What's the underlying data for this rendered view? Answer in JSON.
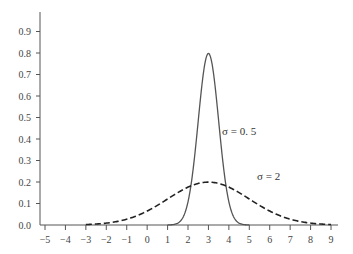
{
  "chart_data": {
    "type": "line",
    "title": "",
    "xlabel": "",
    "ylabel": "",
    "xlim": [
      -5,
      9
    ],
    "ylim": [
      0.0,
      0.9
    ],
    "grid": false,
    "legend": "none (inline annotations)",
    "x_ticks": [
      "−5",
      "−4",
      "−3",
      "−2",
      "−1",
      "0",
      "1",
      "2",
      "3",
      "4",
      "5",
      "6",
      "7",
      "8",
      "9"
    ],
    "y_ticks": [
      "0.0",
      "0.1",
      "0.2",
      "0.3",
      "0.4",
      "0.5",
      "0.6",
      "0.7",
      "0.8",
      "0.9"
    ],
    "series": [
      {
        "name": "σ = 0.5",
        "style": "solid",
        "mean": 3,
        "sd": 0.5,
        "x_range": [
          1,
          5
        ],
        "peak": 0.8,
        "x": [
          1,
          1.5,
          2,
          2.5,
          3,
          3.5,
          4,
          4.5,
          5
        ],
        "values": [
          0.0001,
          0.009,
          0.108,
          0.484,
          0.798,
          0.484,
          0.108,
          0.009,
          0.0001
        ]
      },
      {
        "name": "σ = 2",
        "style": "dashed",
        "mean": 3,
        "sd": 2,
        "x_range": [
          -3,
          9
        ],
        "peak": 0.2,
        "x": [
          -3,
          -2,
          -1,
          0,
          1,
          2,
          3,
          4,
          5,
          6,
          7,
          8,
          9
        ],
        "values": [
          0.002,
          0.009,
          0.027,
          0.065,
          0.121,
          0.176,
          0.199,
          0.176,
          0.121,
          0.065,
          0.027,
          0.009,
          0.002
        ]
      }
    ],
    "annotations": [
      {
        "text": "σ = 0. 5",
        "near": "solid curve right side, y≈0.43"
      },
      {
        "text": "σ = 2",
        "near": "dashed curve right tail, y≈0.15"
      }
    ]
  },
  "labels": {
    "sigma_small": "σ = 0. 5",
    "sigma_large": "σ = 2"
  }
}
